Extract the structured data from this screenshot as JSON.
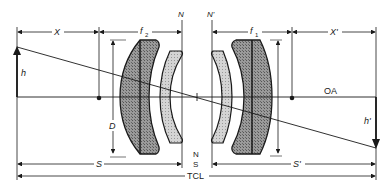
{
  "diagram": {
    "colors": {
      "line": "#1a1a1a",
      "lens_dark": "#8c8c8c",
      "lens_light": "#c8c8c8",
      "background": "#ffffff"
    },
    "labels": {
      "object_distance": "X",
      "image_distance": "X'",
      "front_focal_length": "f",
      "front_focal_sub": "2",
      "rear_focal_length": "f",
      "rear_focal_sub": "1",
      "front_nodal": "N",
      "rear_nodal": "N'",
      "object_height": "h",
      "image_height": "h'",
      "optical_axis": "OA",
      "diameter": "D",
      "nodal_separation_n": "N",
      "nodal_separation_s": "S",
      "object_conjugate": "S",
      "image_conjugate": "S'",
      "total_conjugate_length": "TCL"
    }
  }
}
